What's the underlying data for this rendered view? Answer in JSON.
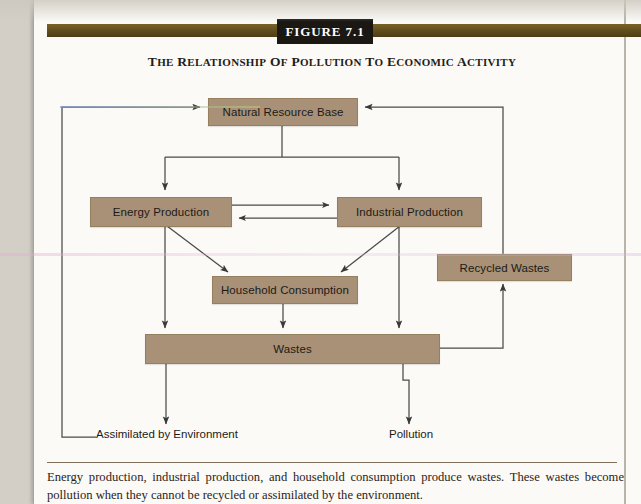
{
  "figure": {
    "tag_label": "FIGURE 7.1",
    "title": "THE RELATIONSHIP OF POLLUTION TO ECONOMIC ACTIVITY",
    "caption": "Energy production, industrial production, and household consumption produce wastes. These wastes become pollution when they cannot be recycled or assimilated by the environment."
  },
  "colors": {
    "node_fill": "#a89177",
    "node_border": "#94805f",
    "header_bar": "#5e4a1b",
    "tag_bg": "#1b1713",
    "line": "#4a4a4a",
    "paper": "#fbfaf7"
  },
  "diagram": {
    "type": "flowchart",
    "nodes": [
      {
        "id": "natural-resource-base",
        "label": "Natural Resource Base",
        "x": 208,
        "y": 98,
        "w": 148,
        "h": 26
      },
      {
        "id": "energy-production",
        "label": "Energy Production",
        "x": 90,
        "y": 197,
        "w": 140,
        "h": 28
      },
      {
        "id": "industrial-production",
        "label": "Industrial Production",
        "x": 337,
        "y": 197,
        "w": 143,
        "h": 28
      },
      {
        "id": "household-consumption",
        "label": "Household Consumption",
        "x": 212,
        "y": 276,
        "w": 144,
        "h": 26
      },
      {
        "id": "recycled-wastes",
        "label": "Recycled Wastes",
        "x": 437,
        "y": 254,
        "w": 133,
        "h": 25
      },
      {
        "id": "wastes",
        "label": "Wastes",
        "x": 145,
        "y": 334,
        "w": 293,
        "h": 28
      }
    ],
    "end_labels": [
      {
        "id": "assimilated-by-environment",
        "label": "Assimilated by Environment",
        "x": 96,
        "y": 433
      },
      {
        "id": "pollution",
        "label": "Pollution",
        "x": 389,
        "y": 433
      }
    ],
    "edges": [
      {
        "from": "natural-resource-base",
        "to": "energy-production",
        "style": "orthogonal"
      },
      {
        "from": "natural-resource-base",
        "to": "industrial-production",
        "style": "orthogonal"
      },
      {
        "from": "energy-production",
        "to": "industrial-production",
        "style": "straight"
      },
      {
        "from": "industrial-production",
        "to": "energy-production",
        "style": "straight"
      },
      {
        "from": "energy-production",
        "to": "household-consumption",
        "style": "diagonal"
      },
      {
        "from": "industrial-production",
        "to": "household-consumption",
        "style": "diagonal"
      },
      {
        "from": "energy-production",
        "to": "wastes",
        "style": "straight"
      },
      {
        "from": "industrial-production",
        "to": "wastes",
        "style": "straight"
      },
      {
        "from": "household-consumption",
        "to": "wastes",
        "style": "straight"
      },
      {
        "from": "wastes",
        "to": "recycled-wastes",
        "style": "orthogonal"
      },
      {
        "from": "recycled-wastes",
        "to": "natural-resource-base",
        "style": "orthogonal"
      },
      {
        "from": "wastes",
        "to": "assimilated-by-environment",
        "style": "straight"
      },
      {
        "from": "wastes",
        "to": "pollution",
        "style": "orthogonal"
      },
      {
        "from": "assimilated-by-environment",
        "to": "natural-resource-base",
        "style": "orthogonal"
      }
    ]
  }
}
